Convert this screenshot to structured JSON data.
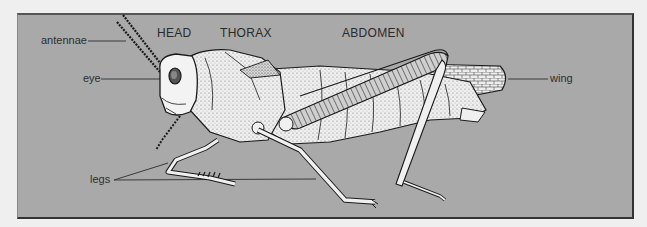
{
  "diagram": {
    "type": "labeled-anatomy-illustration",
    "colors": {
      "page_background": "#efefef",
      "panel_background": "#a9a9a9",
      "panel_border": "#333333",
      "label_text": "#2e2e2e",
      "leader_line": "#3a3a3a",
      "body_fill": "#f2f2f2",
      "outline": "#1a1a1a"
    },
    "region_labels": [
      {
        "id": "head",
        "text": "HEAD"
      },
      {
        "id": "thorax",
        "text": "THORAX"
      },
      {
        "id": "abdomen",
        "text": "ABDOMEN"
      }
    ],
    "part_labels": [
      {
        "id": "antennae",
        "text": "antennae"
      },
      {
        "id": "eye",
        "text": "eye"
      },
      {
        "id": "wing",
        "text": "wing"
      },
      {
        "id": "legs",
        "text": "legs"
      }
    ]
  }
}
